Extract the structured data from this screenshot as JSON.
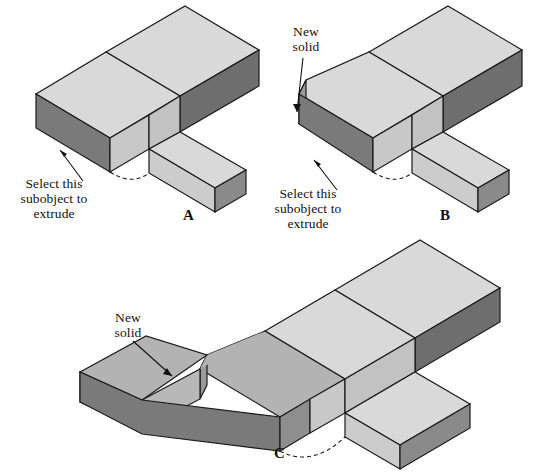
{
  "figure": {
    "type": "technical-illustration",
    "background_color": "#ffffff",
    "palette": {
      "face_top_light": "#d9d9d9",
      "face_side_medium": "#b3b3b3",
      "face_front_dark": "#7a7a7a",
      "face_end_darker": "#6e6e6e",
      "outline": "#1a1a1a",
      "text": "#111111"
    }
  },
  "panels": [
    {
      "id": "A",
      "letter": "A",
      "letter_x": 183,
      "letter_y": 207,
      "annotations": [
        {
          "name": "select-subobject",
          "text": "Select this\nsubobject to\nextrude",
          "x": 2,
          "y": 176,
          "width": 104,
          "arrow": {
            "x1": 83,
            "y1": 181,
            "x2": 59,
            "y2": 149
          }
        }
      ]
    },
    {
      "id": "B",
      "letter": "B",
      "letter_x": 440,
      "letter_y": 207,
      "annotations": [
        {
          "name": "new-solid",
          "text": "New\nsolid",
          "x": 282,
          "y": 24,
          "width": 48,
          "arrow": {
            "x1": 302,
            "y1": 58,
            "x2": 296,
            "y2": 110
          }
        },
        {
          "name": "select-subobject",
          "text": "Select this\nsubobject to\nextrude",
          "x": 256,
          "y": 186,
          "width": 104,
          "arrow": {
            "x1": 336,
            "y1": 190,
            "x2": 313,
            "y2": 160
          }
        }
      ]
    },
    {
      "id": "C",
      "letter": "C",
      "letter_x": 274,
      "letter_y": 449,
      "annotations": [
        {
          "name": "new-solid",
          "text": "New\nsolid",
          "x": 104,
          "y": 310,
          "width": 48,
          "arrow": {
            "x1": 133,
            "y1": 344,
            "x2": 170,
            "y2": 375
          }
        }
      ]
    }
  ],
  "shapes": {
    "A": {
      "main_top": "190,8 262,62 173,118 100,64",
      "main_top2": "262,62 173,118 218,150 303,94",
      "long_top": "190,8 262,62 303,94 231,40",
      "front_dark": "262,62 303,94 303,128 262,96",
      "arm_top": "218,150 262,124 231,106 186,133",
      "arm_side": "186,133 231,106 231,140 186,167",
      "left_front": "30,98 100,64 100,98 30,132",
      "left_side": "30,132 100,98 173,152 173,118"
    }
  },
  "labels": {
    "new_solid": "New\nsolid",
    "select_subobject": "Select this\nsubobject to\nextrude"
  }
}
